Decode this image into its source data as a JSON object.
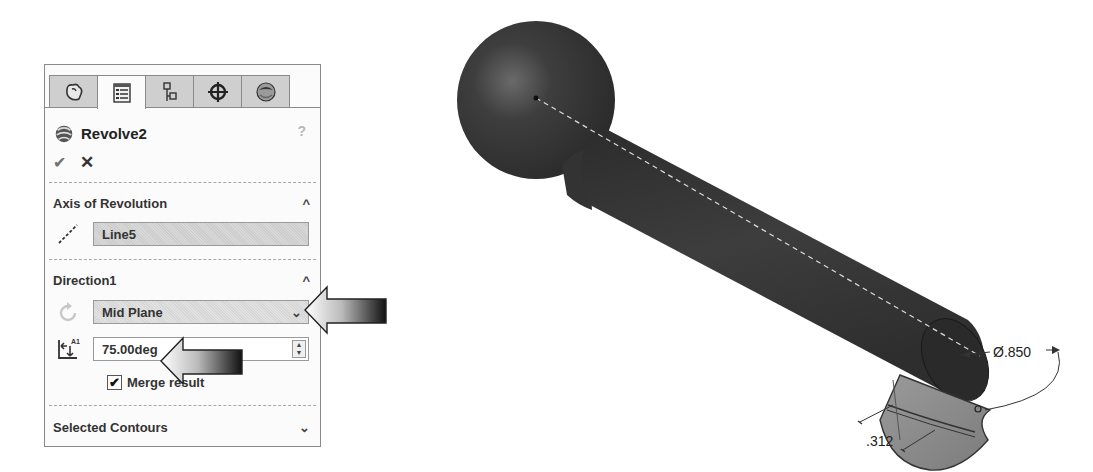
{
  "property_manager": {
    "tabs": [
      {
        "name": "featuremanager",
        "icon": "feature-manager-icon",
        "active": false
      },
      {
        "name": "propertymanager",
        "icon": "property-manager-icon",
        "active": true
      },
      {
        "name": "configurationmanager",
        "icon": "configuration-manager-icon",
        "active": false
      },
      {
        "name": "dimxpertmanager",
        "icon": "dimxpert-icon",
        "active": false
      },
      {
        "name": "displaymanager",
        "icon": "display-manager-icon",
        "active": false
      }
    ],
    "feature_title": "Revolve2",
    "help_glyph": "?",
    "ok_glyph": "✔",
    "cancel_glyph": "✕",
    "sections": {
      "axis": {
        "label": "Axis of Revolution",
        "chevron": "^",
        "axis_value": "Line5"
      },
      "direction1": {
        "label": "Direction1",
        "chevron": "^",
        "end_condition": "Mid Plane",
        "dropdown_chevron": "⌄",
        "angle_value": "75.00deg",
        "angle_icon_label": "A1",
        "merge_result_label": "Merge result",
        "merge_result_checked": true,
        "checkbox_glyph": "✔"
      },
      "selected_contours": {
        "label": "Selected Contours",
        "chevron": "⌄"
      }
    }
  },
  "viewport": {
    "dimensions": {
      "diameter": "Ø.850",
      "thickness": ".312"
    }
  },
  "colors": {
    "model_body": "#3a3a3a",
    "preview_surface": "#8c8c8c",
    "panel_bg": "#fbfbfb",
    "tab_inactive": "#cfcfcf"
  }
}
